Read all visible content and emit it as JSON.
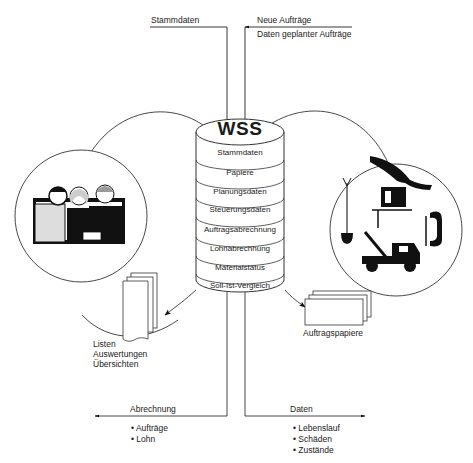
{
  "diagram": {
    "center": {
      "title": "WSS",
      "segments": [
        "Stammdaten",
        "Papiere",
        "Planungsdaten",
        "Steuerungsdaten",
        "Auftragsabrechnung",
        "Lohnabrechnung",
        "Materialstatus",
        "Soll-Ist-Vergleich"
      ]
    },
    "inputs": {
      "left": "Stammdaten",
      "right_line1": "Neue Aufträge",
      "right_line2": "Daten geplanter Aufträge"
    },
    "left_node": {
      "image": "people-meeting-illustration",
      "documents_label": [
        "Listen",
        "Auswertungen",
        "Übersichten"
      ]
    },
    "right_node": {
      "image": "tools-and-vehicles-illustration",
      "documents_label": "Auftragspapiere"
    },
    "outputs": {
      "left": {
        "title": "Abrechnung",
        "items": [
          "Aufträge",
          "Lohn"
        ]
      },
      "right": {
        "title": "Daten",
        "items": [
          "Lebenslauf",
          "Schäden",
          "Zustände"
        ]
      }
    }
  }
}
